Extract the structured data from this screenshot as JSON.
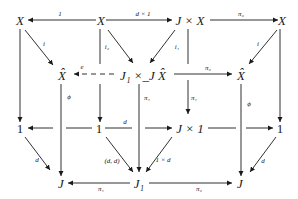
{
  "diagram": {
    "type": "commutative-cube",
    "nodes": {
      "X_tl": "X",
      "X_tm": "X",
      "JxX": "J × X",
      "X_tr": "X",
      "Xhat_l": "X̂",
      "pullback": "J₁ ×_J X̂",
      "Xhat_r": "X̂",
      "one_l": "1",
      "one_m": "1",
      "Jx1": "J × 1",
      "one_r": "1",
      "J_l": "J",
      "J1": "J₁",
      "J_r": "J"
    },
    "labels": {
      "one": "1",
      "d_times_1": "d × 1",
      "pi2_top": "π₂",
      "i_left": "i",
      "i2": "i₂",
      "i1": "i₁",
      "i_right": "i",
      "e": "e",
      "pi2_mid": "π₂",
      "phi_left": "ϕ",
      "pi1_mid": "π₁",
      "pi1_right": "π₁",
      "phi_right": "ϕ",
      "d_mid": "d",
      "d_left": "d",
      "dd": "(d, d)",
      "one_times_d": "1 × d",
      "d_right": "d",
      "pi1_bottom": "π₁",
      "pi2_bottom": "π₂"
    }
  }
}
